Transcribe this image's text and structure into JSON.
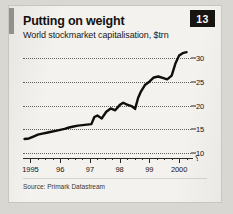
{
  "card": {
    "title": "Putting on weight",
    "subtitle": "World stockmarket capitalisation, $trn",
    "badge": "13",
    "source": "Source: Primark Datastream",
    "zero_break": "⸮"
  },
  "colors": {
    "paper": "#f4f2ee",
    "ink": "#15110f",
    "badge_bg": "#18140f",
    "badge_fg": "#fbfaf8",
    "line": "#100d0b",
    "grid": "#4a4742",
    "accent_bar": "#9a9792"
  },
  "chart_data": {
    "type": "line",
    "title": "Putting on weight",
    "subtitle": "World stockmarket capitalisation, $trn",
    "xlabel": "",
    "ylabel": "$trn",
    "ylim": [
      9,
      32.5
    ],
    "yticks": [
      10,
      15,
      20,
      25,
      30
    ],
    "ytick_labels": [
      "10",
      "15",
      "20",
      "25",
      "30"
    ],
    "grid": true,
    "legend": false,
    "xlim": [
      1994.75,
      2000.4
    ],
    "xticks": [
      1995,
      1996,
      1997,
      1998,
      1999,
      2000
    ],
    "xtick_labels": [
      "1995",
      "96",
      "97",
      "98",
      "99",
      "2000"
    ],
    "minor_xticks_per_year": 4,
    "series": [
      {
        "name": "World stockmarket capitalisation",
        "x": [
          1994.8,
          1994.95,
          1995.1,
          1995.25,
          1995.4,
          1995.55,
          1995.7,
          1995.85,
          1996.0,
          1996.15,
          1996.3,
          1996.45,
          1996.6,
          1996.75,
          1996.9,
          1997.05,
          1997.15,
          1997.25,
          1997.4,
          1997.55,
          1997.7,
          1997.85,
          1998.0,
          1998.12,
          1998.25,
          1998.4,
          1998.52,
          1998.62,
          1998.72,
          1998.85,
          1999.0,
          1999.15,
          1999.3,
          1999.45,
          1999.6,
          1999.75,
          1999.88,
          2000.0,
          2000.12,
          2000.25
        ],
        "y": [
          13.0,
          13.1,
          13.5,
          13.9,
          14.1,
          14.3,
          14.5,
          14.7,
          14.9,
          15.1,
          15.4,
          15.6,
          15.8,
          15.9,
          16.0,
          16.1,
          17.6,
          17.9,
          17.3,
          18.7,
          19.4,
          19.0,
          20.1,
          20.6,
          20.2,
          19.9,
          19.3,
          21.6,
          23.0,
          24.3,
          25.0,
          25.9,
          26.1,
          25.8,
          25.5,
          26.3,
          28.9,
          30.5,
          31.0,
          31.2
        ]
      }
    ]
  }
}
